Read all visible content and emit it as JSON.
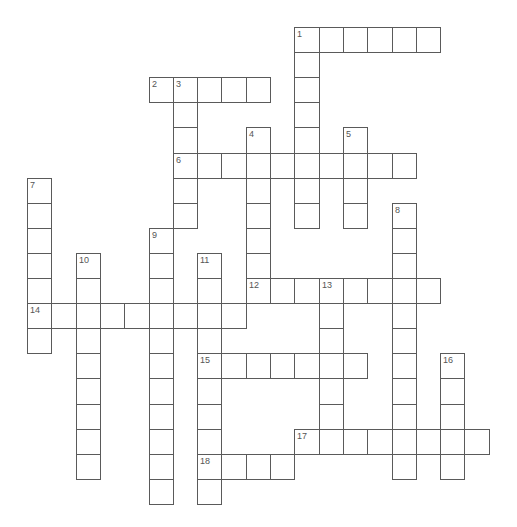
{
  "puzzle": {
    "type": "crossword",
    "cell_width": 24.3,
    "cell_height": 25.1,
    "origin_x": 27,
    "origin_y": 27,
    "line_color": "#5a5a5a",
    "number_color": "#555555"
  },
  "entries": [
    {
      "number": "1",
      "direction": "across",
      "row": 0,
      "col": 11,
      "length": 6
    },
    {
      "number": "1",
      "direction": "down",
      "row": 0,
      "col": 11,
      "length": 8
    },
    {
      "number": "2",
      "direction": "across",
      "row": 2,
      "col": 5,
      "length": 5
    },
    {
      "number": "3",
      "direction": "down",
      "row": 2,
      "col": 6,
      "length": 6
    },
    {
      "number": "4",
      "direction": "down",
      "row": 4,
      "col": 9,
      "length": 7
    },
    {
      "number": "5",
      "direction": "down",
      "row": 4,
      "col": 13,
      "length": 4
    },
    {
      "number": "6",
      "direction": "across",
      "row": 5,
      "col": 6,
      "length": 10
    },
    {
      "number": "7",
      "direction": "down",
      "row": 6,
      "col": 0,
      "length": 7
    },
    {
      "number": "8",
      "direction": "down",
      "row": 7,
      "col": 15,
      "length": 11
    },
    {
      "number": "9",
      "direction": "down",
      "row": 8,
      "col": 5,
      "length": 11
    },
    {
      "number": "10",
      "direction": "down",
      "row": 9,
      "col": 2,
      "length": 9
    },
    {
      "number": "11",
      "direction": "down",
      "row": 9,
      "col": 7,
      "length": 10
    },
    {
      "number": "12",
      "direction": "across",
      "row": 10,
      "col": 9,
      "length": 8
    },
    {
      "number": "13",
      "direction": "down",
      "row": 10,
      "col": 12,
      "length": 7
    },
    {
      "number": "14",
      "direction": "across",
      "row": 11,
      "col": 0,
      "length": 9
    },
    {
      "number": "15",
      "direction": "across",
      "row": 13,
      "col": 7,
      "length": 7
    },
    {
      "number": "16",
      "direction": "down",
      "row": 13,
      "col": 17,
      "length": 5
    },
    {
      "number": "17",
      "direction": "across",
      "row": 16,
      "col": 11,
      "length": 8
    },
    {
      "number": "18",
      "direction": "across",
      "row": 17,
      "col": 7,
      "length": 4
    }
  ]
}
